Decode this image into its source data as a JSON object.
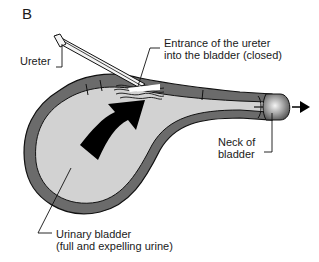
{
  "figure": {
    "panel_letter": "B",
    "colors": {
      "bladder_fill": "#d2d2d2",
      "wall_fill": "#6b6b6b",
      "outline": "#111111",
      "arrow": "#000000",
      "ureter_fill": "#f4f4f4",
      "neck_highlight": "#f2f2f2",
      "neck_shade": "#5a5a5a"
    },
    "labels": {
      "ureter": "Ureter",
      "entrance": {
        "line1": "Entrance of the ureter",
        "line2": "into the bladder (closed)"
      },
      "neck": {
        "line1": "Neck of",
        "line2": "bladder"
      },
      "bladder": {
        "line1": "Urinary bladder",
        "line2": "(full and expelling urine)"
      }
    },
    "icons": {
      "flow_arrow": "curved-arrow-up-right",
      "outflow_arrow": "arrow-right"
    }
  }
}
